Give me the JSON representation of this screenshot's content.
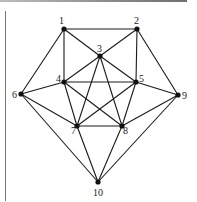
{
  "figure": {
    "type": "graph",
    "nodes": [
      {
        "id": "1",
        "x": 64,
        "y": 29,
        "lx": 59,
        "ly": 24
      },
      {
        "id": "2",
        "x": 137,
        "y": 29,
        "lx": 134,
        "ly": 24
      },
      {
        "id": "3",
        "x": 100,
        "y": 56,
        "lx": 97,
        "ly": 52
      },
      {
        "id": "4",
        "x": 64,
        "y": 82,
        "lx": 56,
        "ly": 82
      },
      {
        "id": "5",
        "x": 136,
        "y": 82,
        "lx": 139,
        "ly": 82
      },
      {
        "id": "6",
        "x": 21,
        "y": 94,
        "lx": 12,
        "ly": 98
      },
      {
        "id": "7",
        "x": 77,
        "y": 126,
        "lx": 71,
        "ly": 134
      },
      {
        "id": "8",
        "x": 122,
        "y": 126,
        "lx": 123,
        "ly": 134
      },
      {
        "id": "9",
        "x": 178,
        "y": 95,
        "lx": 182,
        "ly": 99
      },
      {
        "id": "10",
        "x": 98,
        "y": 182,
        "lx": 93,
        "ly": 196
      }
    ],
    "edges": [
      [
        "1",
        "2"
      ],
      [
        "1",
        "3"
      ],
      [
        "1",
        "4"
      ],
      [
        "1",
        "6"
      ],
      [
        "2",
        "3"
      ],
      [
        "2",
        "5"
      ],
      [
        "2",
        "9"
      ],
      [
        "3",
        "4"
      ],
      [
        "3",
        "5"
      ],
      [
        "3",
        "7"
      ],
      [
        "3",
        "8"
      ],
      [
        "4",
        "5"
      ],
      [
        "4",
        "6"
      ],
      [
        "4",
        "7"
      ],
      [
        "4",
        "8"
      ],
      [
        "5",
        "7"
      ],
      [
        "5",
        "8"
      ],
      [
        "5",
        "9"
      ],
      [
        "6",
        "7"
      ],
      [
        "6",
        "10"
      ],
      [
        "7",
        "8"
      ],
      [
        "7",
        "10"
      ],
      [
        "8",
        "9"
      ],
      [
        "8",
        "10"
      ],
      [
        "9",
        "10"
      ]
    ]
  }
}
